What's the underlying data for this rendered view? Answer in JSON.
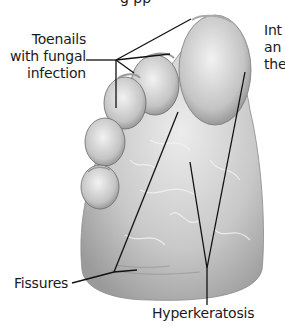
{
  "figure": {
    "top_text_cut": "g    pp",
    "labels": {
      "toenails": [
        "Toenails",
        "with fungal",
        "infection"
      ],
      "side_text": [
        "Int",
        "an",
        "the"
      ],
      "fissures": "Fissures",
      "hyperkeratosis": "Hyperkeratosis"
    },
    "colors": {
      "background": "#ffffff",
      "leader_line": "#111111",
      "text": "#1a1a1a",
      "skin_light": "#e6e6e6",
      "skin_mid": "#bdbdbd",
      "skin_dark": "#8a8a8a"
    }
  }
}
